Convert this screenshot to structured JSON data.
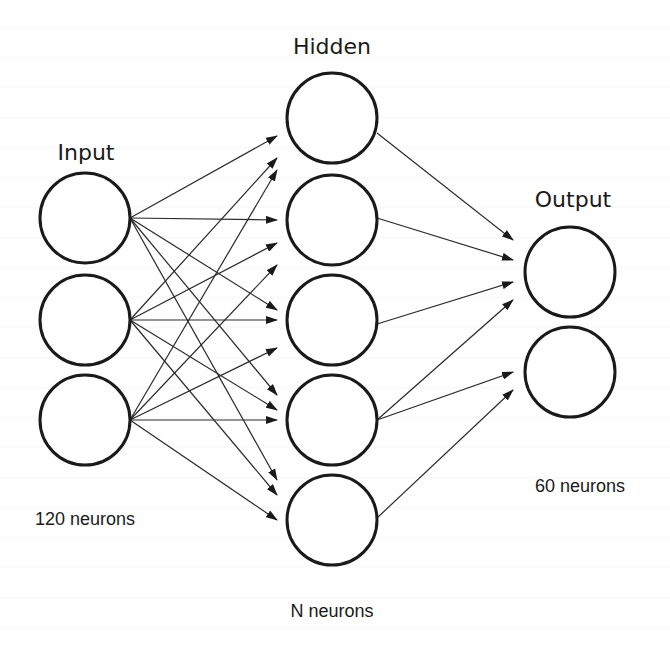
{
  "diagram": {
    "type": "feedforward-neural-network",
    "colors": {
      "background": "#ffffff",
      "stroke": "#1a1a1a",
      "edge": "#2a2a2a",
      "text": "#1a1a1a"
    },
    "layers": [
      {
        "id": "input",
        "title": "Input",
        "count_label": "120 neurons",
        "nodes_drawn": 3,
        "title_pos": [
          86,
          160
        ],
        "count_pos": [
          85,
          525
        ],
        "nodes": [
          [
            85,
            218
          ],
          [
            85,
            320
          ],
          [
            85,
            420
          ]
        ]
      },
      {
        "id": "hidden",
        "title": "Hidden",
        "count_label": "N neurons",
        "nodes_drawn": 5,
        "title_pos": [
          332,
          54
        ],
        "count_pos": [
          332,
          617
        ],
        "nodes": [
          [
            332,
            118
          ],
          [
            332,
            220
          ],
          [
            332,
            320
          ],
          [
            332,
            420
          ],
          [
            332,
            520
          ]
        ]
      },
      {
        "id": "output",
        "title": "Output",
        "count_label": "60 neurons",
        "nodes_drawn": 2,
        "title_pos": [
          573,
          207
        ],
        "count_pos": [
          580,
          492
        ],
        "nodes": [
          [
            570,
            272
          ],
          [
            570,
            372
          ]
        ]
      }
    ],
    "node_radius": 45,
    "connections": {
      "input_to_hidden": [
        {
          "from": [
            130,
            218
          ],
          "to": [
            277,
            136
          ]
        },
        {
          "from": [
            130,
            218
          ],
          "to": [
            277,
            220
          ]
        },
        {
          "from": [
            130,
            218
          ],
          "to": [
            277,
            310
          ]
        },
        {
          "from": [
            130,
            218
          ],
          "to": [
            277,
            395
          ]
        },
        {
          "from": [
            130,
            218
          ],
          "to": [
            277,
            480
          ]
        },
        {
          "from": [
            130,
            320
          ],
          "to": [
            277,
            158
          ]
        },
        {
          "from": [
            130,
            320
          ],
          "to": [
            277,
            243
          ]
        },
        {
          "from": [
            130,
            320
          ],
          "to": [
            277,
            320
          ]
        },
        {
          "from": [
            130,
            320
          ],
          "to": [
            277,
            410
          ]
        },
        {
          "from": [
            130,
            320
          ],
          "to": [
            277,
            495
          ]
        },
        {
          "from": [
            130,
            420
          ],
          "to": [
            277,
            170
          ]
        },
        {
          "from": [
            130,
            420
          ],
          "to": [
            277,
            265
          ]
        },
        {
          "from": [
            130,
            420
          ],
          "to": [
            277,
            348
          ]
        },
        {
          "from": [
            130,
            420
          ],
          "to": [
            277,
            420
          ]
        },
        {
          "from": [
            130,
            420
          ],
          "to": [
            277,
            520
          ]
        }
      ],
      "hidden_to_output": [
        {
          "from": [
            377,
            133
          ],
          "to": [
            513,
            240
          ]
        },
        {
          "from": [
            377,
            218
          ],
          "to": [
            513,
            260
          ]
        },
        {
          "from": [
            377,
            324
          ],
          "to": [
            513,
            282
          ]
        },
        {
          "from": [
            377,
            420
          ],
          "to": [
            513,
            300
          ]
        },
        {
          "from": [
            377,
            420
          ],
          "to": [
            513,
            372
          ]
        },
        {
          "from": [
            377,
            518
          ],
          "to": [
            513,
            390
          ]
        }
      ]
    }
  }
}
